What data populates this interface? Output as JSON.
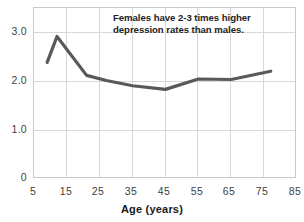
{
  "chart_data": {
    "type": "line",
    "title": "",
    "subtitle": "",
    "xlabel": "Age (years)",
    "ylabel": "",
    "xlim": [
      5,
      85
    ],
    "ylim": [
      0,
      3.3
    ],
    "grid": true,
    "legend": false,
    "annotations": [
      {
        "name": "females-depression-note",
        "text": "Females have 2-3 times higher depression rates than males."
      }
    ],
    "xticks": [
      "5",
      "15",
      "25",
      "35",
      "45",
      "55",
      "65",
      "75",
      "85"
    ],
    "xtick_values": [
      5,
      15,
      25,
      35,
      45,
      55,
      65,
      75,
      85
    ],
    "yticks": [
      "0",
      "1.0",
      "2.0",
      "3.0"
    ],
    "ytick_values": [
      0,
      1.0,
      2.0,
      3.0
    ],
    "series": [
      {
        "name": "female-to-male depression ratio",
        "color": "#595959",
        "x": [
          9,
          12,
          21,
          27,
          35,
          45,
          55,
          65,
          77
        ],
        "values": [
          2.25,
          2.75,
          2.0,
          1.9,
          1.8,
          1.73,
          1.93,
          1.92,
          2.08
        ]
      }
    ]
  },
  "axes": {
    "x_title": "Age (years)"
  },
  "colors": {
    "line": "#595959",
    "grid": "#d8d8d8",
    "frame": "#c9c9c9",
    "text": "#3f3f3f",
    "annotation_text": "#222222",
    "background": "#ffffff"
  }
}
